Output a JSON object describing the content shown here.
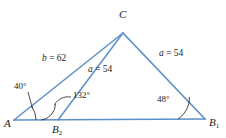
{
  "figure": {
    "stroke_color": "#5b8fc9",
    "text_color": "#1a1a1a",
    "background": "#ffffff"
  },
  "vertices": [
    {
      "id": "C",
      "label": "C",
      "sub": "",
      "x": 123,
      "y": 33
    },
    {
      "id": "A",
      "label": "A",
      "sub": "",
      "x": 14,
      "y": 120
    },
    {
      "id": "B1",
      "label": "B",
      "sub": "1",
      "x": 205,
      "y": 119
    },
    {
      "id": "B2",
      "label": "B",
      "sub": "2",
      "x": 58,
      "y": 120
    }
  ],
  "side_labels": [
    {
      "id": "b",
      "var": "b",
      "eq": " = ",
      "value": "62"
    },
    {
      "id": "a1",
      "var": "a",
      "eq": " = ",
      "value": "54"
    },
    {
      "id": "a2",
      "var": "a",
      "eq": " = ",
      "value": "54"
    }
  ],
  "angle_labels": [
    {
      "id": "angle-A",
      "text": "40°"
    },
    {
      "id": "angle-B2",
      "text": "132°"
    },
    {
      "id": "angle-B1",
      "text": "48°"
    }
  ]
}
